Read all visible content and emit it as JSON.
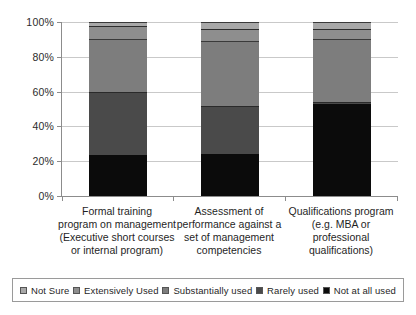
{
  "chart_data": {
    "type": "bar",
    "stacked": true,
    "stack_total": 100,
    "title": "",
    "subtitle": "",
    "xlabel": "",
    "ylabel": "",
    "ylim": [
      0,
      100
    ],
    "yticks": [
      0,
      20,
      40,
      60,
      80,
      100
    ],
    "ytick_labels": [
      "0%",
      "20%",
      "40%",
      "60%",
      "80%",
      "100%"
    ],
    "grid": true,
    "legend_position": "bottom",
    "categories": [
      "Formal training program on management (Executive short courses or internal program)",
      "Assessment of performance against a set of management competencies",
      "Qualifications program (e.g. MBA or professional qualifications)"
    ],
    "category_lines": [
      [
        "Formal training",
        "program on management",
        "(Executive short courses",
        "or internal program)"
      ],
      [
        "Assessment of",
        "performance against a",
        "set of management",
        "competencies"
      ],
      [
        "Qualifications program",
        "(e.g. MBA or",
        "professional",
        "qualifications)"
      ]
    ],
    "series": [
      {
        "name": "Not at all used",
        "color": "#0b0b0b",
        "values": [
          23.5,
          24.0,
          53.0
        ]
      },
      {
        "name": "Rarely used",
        "color": "#4a4a4a",
        "values": [
          36.5,
          28.0,
          1.0
        ]
      },
      {
        "name": "Substantially used",
        "color": "#7d7d7d",
        "values": [
          30.0,
          37.0,
          36.0
        ]
      },
      {
        "name": "Extensively Used",
        "color": "#8e8e8e",
        "values": [
          7.5,
          7.0,
          6.0
        ]
      },
      {
        "name": "Not Sure",
        "color": "#a8a8a8",
        "values": [
          2.5,
          4.0,
          4.0
        ]
      }
    ],
    "legend_entries": [
      {
        "label": "Not Sure",
        "color": "#a8a8a8"
      },
      {
        "label": "Extensively Used",
        "color": "#8e8e8e"
      },
      {
        "label": "Substantially used",
        "color": "#7d7d7d"
      },
      {
        "label": "Rarely used",
        "color": "#4a4a4a"
      },
      {
        "label": "Not at all used",
        "color": "#0b0b0b"
      }
    ]
  }
}
